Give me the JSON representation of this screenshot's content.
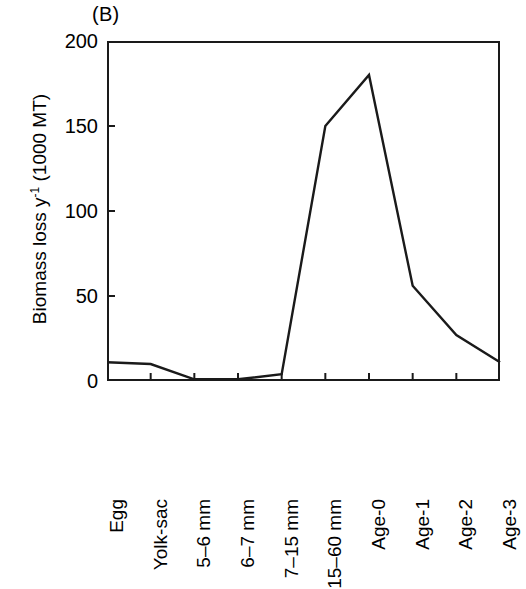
{
  "chart_data": {
    "type": "line",
    "title": "",
    "panel_label": "(B)",
    "xlabel": "",
    "ylabel": "Biomass loss y⁻¹ (1000 MT)",
    "ylabel_main": "Biomass loss y",
    "ylabel_sup": "-1",
    "ylabel_tail": " (1000 MT)",
    "categories": [
      "Egg",
      "Yolk-sac",
      "5–6 mm",
      "6–7 mm",
      "7–15 mm",
      "15–60 mm",
      "Age-0",
      "Age-1",
      "Age-2",
      "Age-3"
    ],
    "values": [
      11,
      10,
      1,
      1,
      4,
      150,
      180,
      56,
      27,
      11
    ],
    "ylim": [
      0,
      200
    ],
    "yticks": [
      0,
      50,
      100,
      150,
      200
    ],
    "ytick_labels": [
      "0",
      "50",
      "100",
      "150",
      "200"
    ],
    "grid": false,
    "legend": false,
    "line_color": "#1a1a1a",
    "line_width": 2.4,
    "axis_color": "#1a1a1a",
    "background": "#ffffff"
  }
}
